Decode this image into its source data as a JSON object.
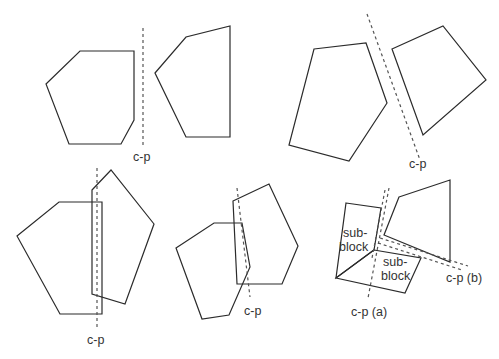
{
  "figure": {
    "panels": [
      {
        "id": "top-left",
        "cut_label": "c-p",
        "shapes": [
          {
            "name": "left-polygon",
            "points": "46,84 80,51 134,51 134,120 121,144 69,144"
          },
          {
            "name": "right-polygon",
            "points": "155,73 186,37 230,26 230,137 186,137"
          }
        ],
        "cut_lines": [
          {
            "name": "cutting-plane",
            "x1": 143,
            "y1": 28,
            "x2": 143,
            "y2": 146
          }
        ],
        "label_pos": [
          133,
          161
        ]
      },
      {
        "id": "top-right",
        "cut_label": "c-p",
        "shapes": [
          {
            "name": "pentagon",
            "points": "314,49 366,43 387,103 349,161 289,145"
          },
          {
            "name": "quadrilateral",
            "points": "392,49 443,26 486,80 423,135"
          }
        ],
        "cut_lines": [
          {
            "name": "cutting-plane",
            "x1": 367,
            "y1": 14,
            "x2": 420,
            "y2": 160
          }
        ],
        "label_pos": [
          409,
          168
        ]
      },
      {
        "id": "bottom-left",
        "cut_label": "c-p",
        "shapes": [
          {
            "name": "left-pentagon",
            "points": "17,236 59,202 102,202 102,314 60,314"
          },
          {
            "name": "right-pentagon",
            "points": "92,190 111,170 154,224 125,304 92,294"
          }
        ],
        "cut_lines": [
          {
            "name": "cutting-plane",
            "x1": 97,
            "y1": 168,
            "x2": 97,
            "y2": 330
          }
        ],
        "label_pos": [
          87,
          344
        ]
      },
      {
        "id": "bottom-middle",
        "cut_label": "c-p",
        "shapes": [
          {
            "name": "left-hexagon",
            "points": "176,248 214,223 242,223 250,267 229,315 202,319"
          },
          {
            "name": "right-pentagon",
            "points": "233,201 269,184 298,246 282,284 237,284"
          }
        ],
        "cut_lines": [
          {
            "name": "cutting-plane",
            "x1": 237,
            "y1": 188,
            "x2": 250,
            "y2": 297
          }
        ],
        "label_pos": [
          244,
          315
        ]
      },
      {
        "id": "bottom-right",
        "shapes": [
          {
            "name": "sub-block-upper",
            "points": "346,203 381,208 374,250 336,278"
          },
          {
            "name": "sub-block-lower",
            "points": "374,250 421,258 405,293 336,278"
          },
          {
            "name": "right-quadrilateral",
            "points": "399,197 450,180 450,262 384,235"
          }
        ],
        "cut_lines": [
          {
            "name": "cutting-plane-a-1",
            "x1": 389,
            "y1": 188,
            "x2": 368,
            "y2": 298
          },
          {
            "name": "cutting-plane-a-2",
            "x1": 386,
            "y1": 188,
            "x2": 372,
            "y2": 258
          },
          {
            "name": "cutting-plane-b-1",
            "x1": 380,
            "y1": 238,
            "x2": 468,
            "y2": 266
          },
          {
            "name": "cutting-plane-b-2",
            "x1": 378,
            "y1": 243,
            "x2": 462,
            "y2": 270
          }
        ],
        "sub_block_labels": [
          {
            "lines": [
              "sub-",
              "block"
            ],
            "x": 343,
            "y": 237
          },
          {
            "lines": [
              "sub-",
              "block"
            ],
            "x": 381,
            "y": 266
          }
        ],
        "cut_label_a": "c-p (a)",
        "cut_label_b": "c-p (b)",
        "label_a_pos": [
          351,
          316
        ],
        "label_b_pos": [
          446,
          282
        ]
      }
    ],
    "colors": {
      "stroke": "#2b2b2b",
      "dash": "#555555",
      "text": "#333333",
      "background": "#ffffff"
    }
  }
}
